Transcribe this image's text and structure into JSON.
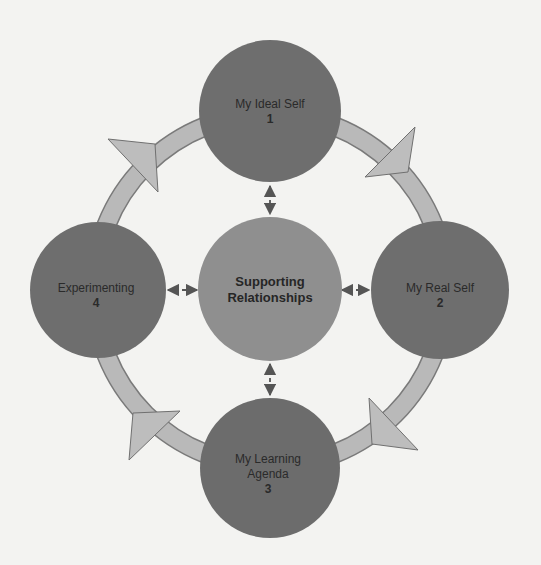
{
  "diagram": {
    "colors": {
      "background": "#f3f3f1",
      "stage_fill": "#6e6e6e",
      "center_fill": "#8f8f8f",
      "ring_fill": "#b9b9b9",
      "ring_stroke": "#7a7a7a",
      "text": "#2a2a2a"
    },
    "center": {
      "line1": "Supporting",
      "line2": "Relationships"
    },
    "stages": [
      {
        "id": "ideal-self",
        "line1": "My Ideal Self",
        "number": "1",
        "position": "top"
      },
      {
        "id": "real-self",
        "line1": "My Real Self",
        "number": "2",
        "position": "right"
      },
      {
        "id": "learning-agenda",
        "line1": "My Learning",
        "line2": "Agenda",
        "number": "3",
        "position": "bottom"
      },
      {
        "id": "experimenting",
        "line1": "Experimenting",
        "number": "4",
        "position": "left"
      }
    ],
    "cycle_direction": "clockwise",
    "connectors": "dashed bidirectional arrows between center and each stage"
  }
}
